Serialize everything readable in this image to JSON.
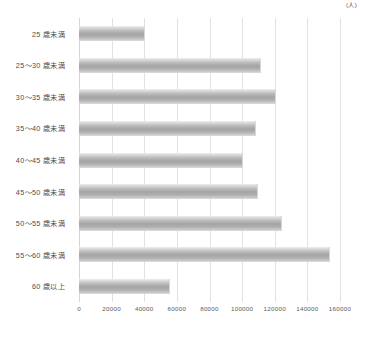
{
  "chart_data": {
    "type": "bar",
    "orientation": "horizontal",
    "title": "",
    "subtitle": "",
    "xlabel": "(人)",
    "ylabel": "",
    "xlim": [
      0,
      160000
    ],
    "grid": true,
    "legend": null,
    "unit_label": "(人)",
    "xticks": [
      0,
      20000,
      40000,
      60000,
      80000,
      100000,
      120000,
      140000,
      160000
    ],
    "xtick_labels": [
      "0",
      "20000",
      "40000",
      "60000",
      "80000",
      "100000",
      "120000",
      "140000",
      "160000"
    ],
    "categories": [
      "25 歳未満",
      "25～30 歳未満",
      "30～35 歳未満",
      "35～40 歳未満",
      "40～45 歳未満",
      "45～50 歳未満",
      "50～55 歳未満",
      "55～60 歳未満",
      "60 歳以上"
    ],
    "values": [
      40000,
      111000,
      120000,
      108000,
      100000,
      109000,
      124000,
      153000,
      55000
    ],
    "bar_color": "#a8a8a8",
    "gridline_color": "#e2e2e2",
    "axis_color": "#d4d4d4",
    "label_color": "#4c4c4c"
  }
}
